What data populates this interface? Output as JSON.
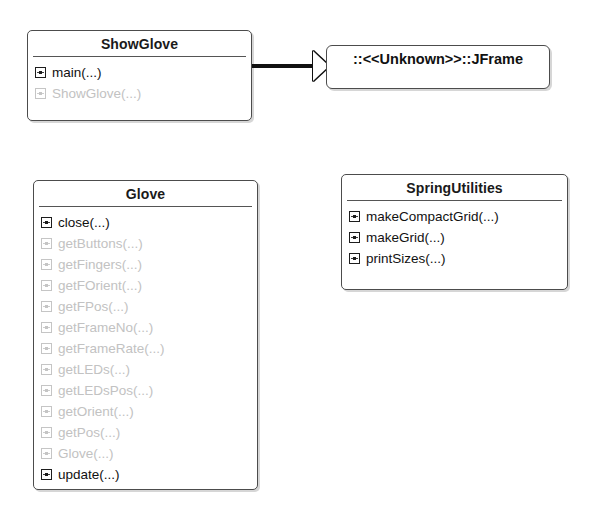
{
  "diagram": {
    "type": "uml-class-diagram",
    "background_color": "#ffffff",
    "line_color": "#4c4c4c",
    "text_color": "#111111",
    "faded_text_color": "#c2c2c2"
  },
  "classes": [
    {
      "id": "showglove",
      "name": "ShowGlove",
      "members": [
        {
          "name": "main(...)",
          "icon": "method-icon",
          "state": "dark"
        },
        {
          "name": "ShowGlove(...)",
          "icon": "method-icon",
          "state": "faded"
        }
      ]
    },
    {
      "id": "glove",
      "name": "Glove",
      "members": [
        {
          "name": "close(...)",
          "icon": "method-icon",
          "state": "dark"
        },
        {
          "name": "getButtons(...)",
          "icon": "method-icon",
          "state": "faded"
        },
        {
          "name": "getFingers(...)",
          "icon": "method-icon",
          "state": "faded"
        },
        {
          "name": "getFOrient(...)",
          "icon": "method-icon",
          "state": "faded"
        },
        {
          "name": "getFPos(...)",
          "icon": "method-icon",
          "state": "faded"
        },
        {
          "name": "getFrameNo(...)",
          "icon": "method-icon",
          "state": "faded"
        },
        {
          "name": "getFrameRate(...)",
          "icon": "method-icon",
          "state": "faded"
        },
        {
          "name": "getLEDs(...)",
          "icon": "method-icon",
          "state": "faded"
        },
        {
          "name": "getLEDsPos(...)",
          "icon": "method-icon",
          "state": "faded"
        },
        {
          "name": "getOrient(...)",
          "icon": "method-icon",
          "state": "faded"
        },
        {
          "name": "getPos(...)",
          "icon": "method-icon",
          "state": "faded"
        },
        {
          "name": "Glove(...)",
          "icon": "method-icon",
          "state": "faded"
        },
        {
          "name": "update(...)",
          "icon": "method-icon",
          "state": "dark"
        }
      ]
    },
    {
      "id": "springutilities",
      "name": "SpringUtilities",
      "members": [
        {
          "name": "makeCompactGrid(...)",
          "icon": "method-icon",
          "state": "dark"
        },
        {
          "name": "makeGrid(...)",
          "icon": "method-icon",
          "state": "dark"
        },
        {
          "name": "printSizes(...)",
          "icon": "method-icon",
          "state": "dark"
        }
      ]
    }
  ],
  "external_classes": [
    {
      "id": "jframe",
      "label": "::<<Unknown>>::JFrame"
    }
  ],
  "relationships": [
    {
      "id": "showglove-extends-jframe",
      "type": "generalization",
      "from": "ShowGlove",
      "to": "::<<Unknown>>::JFrame",
      "arrow": "hollow-triangle"
    }
  ]
}
